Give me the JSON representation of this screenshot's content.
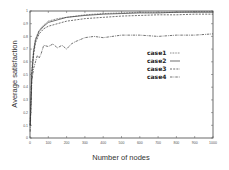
{
  "chart_data": {
    "type": "line",
    "title": "",
    "xlabel": "Number of nodes",
    "ylabel": "Average satisfaction",
    "xlim": [
      0,
      1000
    ],
    "ylim": [
      0,
      1
    ],
    "xticks": [
      0,
      100,
      200,
      300,
      400,
      500,
      600,
      700,
      800,
      900,
      1000
    ],
    "yticks": [
      0,
      0.1,
      0.2,
      0.3,
      0.4,
      0.5,
      0.6,
      0.7,
      0.8,
      0.9,
      1
    ],
    "grid": false,
    "legend_position": "center-right",
    "series": [
      {
        "name": "case1",
        "style": "dotted",
        "x": [
          1,
          10,
          20,
          30,
          50,
          75,
          100,
          150,
          200,
          300,
          400,
          500,
          600,
          700,
          800,
          900,
          1000
        ],
        "y": [
          0.1,
          0.55,
          0.7,
          0.78,
          0.85,
          0.89,
          0.92,
          0.94,
          0.95,
          0.97,
          0.98,
          0.985,
          0.99,
          0.99,
          0.99,
          0.995,
          0.995
        ]
      },
      {
        "name": "case2",
        "style": "solid",
        "x": [
          1,
          10,
          20,
          30,
          50,
          75,
          100,
          150,
          200,
          300,
          400,
          500,
          600,
          700,
          800,
          900,
          1000
        ],
        "y": [
          0.1,
          0.5,
          0.68,
          0.77,
          0.84,
          0.88,
          0.91,
          0.93,
          0.95,
          0.965,
          0.975,
          0.98,
          0.985,
          0.985,
          0.99,
          0.99,
          0.99
        ]
      },
      {
        "name": "case3",
        "style": "dashed",
        "x": [
          1,
          10,
          20,
          30,
          50,
          75,
          100,
          150,
          200,
          300,
          400,
          500,
          600,
          700,
          800,
          900,
          1000
        ],
        "y": [
          0.1,
          0.5,
          0.66,
          0.75,
          0.82,
          0.86,
          0.88,
          0.9,
          0.92,
          0.94,
          0.95,
          0.96,
          0.965,
          0.97,
          0.97,
          0.975,
          0.975
        ]
      },
      {
        "name": "case4",
        "style": "dash-dot",
        "x": [
          1,
          10,
          20,
          30,
          40,
          50,
          60,
          75,
          100,
          125,
          150,
          175,
          200,
          225,
          250,
          300,
          350,
          400,
          500,
          600,
          700,
          800,
          900,
          1000
        ],
        "y": [
          0.05,
          0.45,
          0.55,
          0.6,
          0.65,
          0.63,
          0.66,
          0.73,
          0.72,
          0.74,
          0.71,
          0.73,
          0.7,
          0.74,
          0.76,
          0.79,
          0.8,
          0.79,
          0.81,
          0.81,
          0.8,
          0.81,
          0.81,
          0.82
        ]
      }
    ]
  }
}
